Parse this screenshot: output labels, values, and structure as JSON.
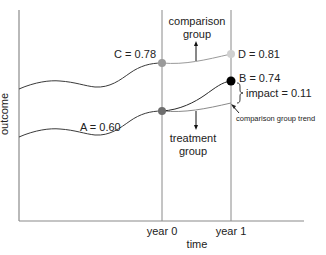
{
  "diagram": {
    "y_axis_label": "outcome",
    "x_axis_label": "time",
    "x_ticks": [
      {
        "label": "year 0"
      },
      {
        "label": "year 1"
      }
    ],
    "points": {
      "C": {
        "label": "C = 0.78",
        "value": 0.78,
        "color": "#9a9a9a"
      },
      "A": {
        "label": "A = 0.60",
        "value": 0.6,
        "color": "#6e6e6e"
      },
      "D": {
        "label": "D = 0.81",
        "value": 0.81,
        "color": "#cfcfcf"
      },
      "B": {
        "label": "B = 0.74",
        "value": 0.74,
        "color": "#000000"
      }
    },
    "annotations": {
      "comparison_group_line1": "comparison",
      "comparison_group_line2": "group",
      "treatment_group_line1": "treatment",
      "treatment_group_line2": "group",
      "impact": "impact = 0.11",
      "comparison_trend": "comparison group trend"
    },
    "colors": {
      "axis": "#8a8a8a",
      "comparison_line": "#8a8a8a",
      "treatment_line": "#3a3a3a"
    }
  }
}
